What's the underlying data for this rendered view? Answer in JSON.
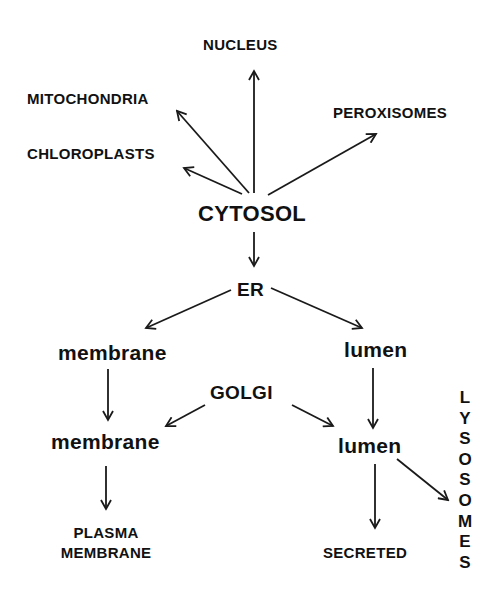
{
  "diagram": {
    "nodes": {
      "nucleus": "NUCLEUS",
      "mitochondria": "MITOCHONDRIA",
      "chloroplasts": "CHLOROPLASTS",
      "peroxisomes": "PEROXISOMES",
      "cytosol": "CYTOSOL",
      "er": "ER",
      "er_membrane": "membrane",
      "er_lumen": "lumen",
      "golgi": "GOLGI",
      "golgi_membrane": "membrane",
      "golgi_lumen": "lumen",
      "plasma_membrane_line1": "PLASMA",
      "plasma_membrane_line2": "MEMBRANE",
      "secreted": "SECRETED",
      "lysosomes": [
        "L",
        "Y",
        "S",
        "O",
        "S",
        "O",
        "M",
        "E",
        "S"
      ]
    },
    "edges": [
      {
        "from": "CYTOSOL",
        "to": "NUCLEUS"
      },
      {
        "from": "CYTOSOL",
        "to": "MITOCHONDRIA"
      },
      {
        "from": "CYTOSOL",
        "to": "CHLOROPLASTS"
      },
      {
        "from": "CYTOSOL",
        "to": "PEROXISOMES"
      },
      {
        "from": "CYTOSOL",
        "to": "ER"
      },
      {
        "from": "ER",
        "to": "ER membrane"
      },
      {
        "from": "ER",
        "to": "ER lumen"
      },
      {
        "from": "ER membrane",
        "to": "Golgi membrane"
      },
      {
        "from": "ER lumen",
        "to": "Golgi lumen"
      },
      {
        "from": "GOLGI",
        "to": "Golgi membrane"
      },
      {
        "from": "GOLGI",
        "to": "Golgi lumen"
      },
      {
        "from": "Golgi membrane",
        "to": "PLASMA MEMBRANE"
      },
      {
        "from": "Golgi lumen",
        "to": "SECRETED"
      },
      {
        "from": "Golgi lumen",
        "to": "LYSOSOMES"
      }
    ],
    "colors": {
      "background": "#ffffff",
      "ink": "#111111"
    }
  }
}
